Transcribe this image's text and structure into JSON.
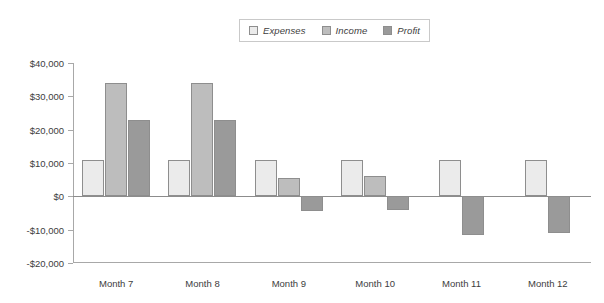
{
  "chart_data": {
    "type": "bar",
    "title": "",
    "subtitle": "",
    "xlabel": "",
    "ylabel": "",
    "categories": [
      "Month 7",
      "Month 8",
      "Month 9",
      "Month 10",
      "Month 11",
      "Month 12"
    ],
    "series": [
      {
        "name": "Expenses",
        "color": "#ebebeb",
        "values": [
          11000,
          11000,
          11000,
          11000,
          11000,
          11000
        ]
      },
      {
        "name": "Income",
        "color": "#bdbdbd",
        "values": [
          34000,
          34000,
          5500,
          6000,
          null,
          null
        ]
      },
      {
        "name": "Profit",
        "color": "#9a9a9a",
        "values": [
          23000,
          23000,
          -4500,
          -4000,
          -11500,
          -11000
        ]
      }
    ],
    "ylim": [
      -20000,
      40000
    ],
    "ytick_values": [
      40000,
      30000,
      20000,
      10000,
      0,
      -10000,
      -20000
    ],
    "ytick_labels": [
      "$40,000",
      "$30,000",
      "$20,000",
      "$10,000",
      "$0",
      "-$10,000",
      "-$20,000"
    ],
    "grid": false,
    "legend_position": "top-center",
    "legend_entries": [
      "Expenses",
      "Income",
      "Profit"
    ]
  },
  "legend": {
    "items": [
      {
        "label": "Expenses"
      },
      {
        "label": "Income"
      },
      {
        "label": "Profit"
      }
    ]
  }
}
